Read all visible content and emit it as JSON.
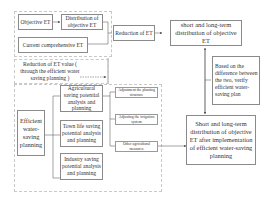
{
  "diagram": {
    "nodes": {
      "objective_et": "Objective ET",
      "distribution_objective_et": "Distribution of objective ET",
      "current_comprehensive_et": "Current comprehensive ET",
      "reduction_of_et": "Reduction of ET",
      "short_long_term_distribution": "short and long-term distribution of objective ET",
      "reduction_et_value": "Reduction of ET value ( through the efficient water saving planning )",
      "efficient_water_saving_planning": "Efficient water-saving planning",
      "agricultural_saving": "Agricultural saving potential analysis and planning",
      "town_life_saving": "Town life saving potential analysis and planning",
      "industry_saving": "Industry saving potential analysis and planning",
      "adjust_planting_structure": "Adjustment the planting structure",
      "adjust_irrigation_system": "Adjusting the irrigation system",
      "other_agricultural_measures": "Other agricultural measures",
      "verify_note": "Based on the difference between the two, verify efficient water-saving plan",
      "after_implementation": "Short and long-term distribution of objective ET after implementation of efficient water-saving planning"
    }
  }
}
